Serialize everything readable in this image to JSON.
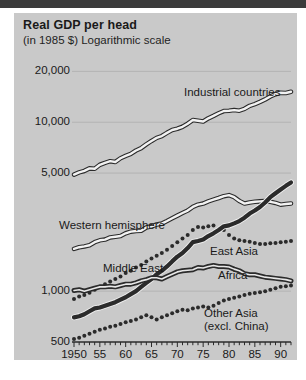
{
  "figure": {
    "title": "Real GDP per head",
    "subtitle": "(in 1985 $) Logarithmic scale",
    "panel_color": "#c9c9c9",
    "page_color": "#ffffff",
    "top_bar_color": "#3b3b3b"
  },
  "axes": {
    "y_ticks": [
      "500",
      "1,000",
      "5,000",
      "10,000",
      "20,000"
    ],
    "x_ticks": [
      "1950",
      "55",
      "60",
      "65",
      "70",
      "75",
      "80",
      "85",
      "90"
    ]
  },
  "labels": {
    "industrial": "Industrial countries",
    "western": "Western hemisphere",
    "middle_east": "Middle East",
    "east_asia": "East Asia",
    "africa": "Africa",
    "other_asia": "Other Asia",
    "other_asia_2": "(excl. China)"
  },
  "chart_data": {
    "type": "line",
    "title": "Real GDP per head",
    "subtitle": "(in 1985 $) Logarithmic scale",
    "xlabel": "",
    "ylabel": "Real GDP per head (1985 $)",
    "yscale": "log",
    "ylim": [
      500,
      24000
    ],
    "ytick_values": [
      500,
      1000,
      5000,
      10000,
      20000
    ],
    "ytick_labels": [
      "500",
      "1,000",
      "5,000",
      "10,000",
      "20,000"
    ],
    "xlim": [
      1950,
      1992
    ],
    "xtick_values": [
      1950,
      1955,
      1960,
      1965,
      1970,
      1975,
      1980,
      1985,
      1990
    ],
    "xtick_labels": [
      "1950",
      "55",
      "60",
      "65",
      "70",
      "75",
      "80",
      "85",
      "90"
    ],
    "grid": "horizontal",
    "legend": "inline-annotations",
    "x": [
      1950,
      1951,
      1952,
      1953,
      1954,
      1955,
      1956,
      1957,
      1958,
      1959,
      1960,
      1961,
      1962,
      1963,
      1964,
      1965,
      1966,
      1967,
      1968,
      1969,
      1970,
      1971,
      1972,
      1973,
      1974,
      1975,
      1976,
      1977,
      1978,
      1979,
      1980,
      1981,
      1982,
      1983,
      1984,
      1985,
      1986,
      1987,
      1988,
      1989,
      1990,
      1991,
      1992
    ],
    "series": [
      {
        "name": "Industrial countries",
        "style": "white-line-dark-outline",
        "values": [
          4900,
          5050,
          5150,
          5330,
          5300,
          5600,
          5750,
          5880,
          5820,
          6120,
          6320,
          6500,
          6800,
          7030,
          7400,
          7750,
          8080,
          8280,
          8650,
          9000,
          9150,
          9400,
          9800,
          10300,
          10200,
          10100,
          10550,
          10900,
          11300,
          11650,
          11700,
          11800,
          11700,
          12000,
          12500,
          12800,
          13200,
          13650,
          14200,
          14650,
          14950,
          14900,
          15150
        ]
      },
      {
        "name": "Western hemisphere",
        "style": "white-line-dark-outline",
        "values": [
          1780,
          1820,
          1840,
          1870,
          1950,
          2000,
          2020,
          2080,
          2100,
          2120,
          2200,
          2250,
          2270,
          2280,
          2380,
          2420,
          2480,
          2510,
          2600,
          2700,
          2800,
          2900,
          3000,
          3150,
          3250,
          3300,
          3400,
          3480,
          3560,
          3650,
          3700,
          3600,
          3420,
          3300,
          3350,
          3380,
          3400,
          3420,
          3380,
          3330,
          3250,
          3280,
          3300
        ]
      },
      {
        "name": "Middle East",
        "style": "dotted",
        "values": [
          900,
          930,
          950,
          980,
          1020,
          1060,
          1100,
          1140,
          1180,
          1220,
          1280,
          1320,
          1380,
          1430,
          1500,
          1560,
          1620,
          1680,
          1760,
          1850,
          1950,
          2050,
          2150,
          2300,
          2400,
          2380,
          2420,
          2450,
          2330,
          2300,
          2150,
          2050,
          2000,
          1980,
          1960,
          1930,
          1900,
          1900,
          1920,
          1930,
          1950,
          1960,
          1980
        ]
      },
      {
        "name": "East Asia",
        "style": "thick-dark-line",
        "values": [
          700,
          710,
          730,
          760,
          790,
          800,
          820,
          840,
          860,
          890,
          920,
          960,
          1000,
          1060,
          1120,
          1180,
          1260,
          1320,
          1400,
          1500,
          1600,
          1680,
          1800,
          1950,
          1980,
          2020,
          2120,
          2200,
          2300,
          2420,
          2450,
          2520,
          2600,
          2720,
          2880,
          3000,
          3150,
          3350,
          3600,
          3800,
          4000,
          4200,
          4400
        ]
      },
      {
        "name": "Africa",
        "style": "dark-line-white-core",
        "values": [
          1010,
          1020,
          1000,
          1020,
          1040,
          1060,
          1060,
          1070,
          1060,
          1080,
          1100,
          1100,
          1120,
          1150,
          1170,
          1200,
          1200,
          1180,
          1220,
          1260,
          1300,
          1320,
          1330,
          1340,
          1380,
          1370,
          1400,
          1420,
          1400,
          1400,
          1390,
          1350,
          1320,
          1270,
          1250,
          1250,
          1230,
          1210,
          1200,
          1190,
          1180,
          1170,
          1150
        ]
      },
      {
        "name": "Other Asia (excl. China)",
        "style": "dotted",
        "values": [
          520,
          530,
          545,
          560,
          575,
          590,
          600,
          615,
          625,
          640,
          655,
          665,
          680,
          700,
          720,
          700,
          680,
          700,
          720,
          740,
          760,
          775,
          770,
          790,
          800,
          810,
          800,
          820,
          850,
          880,
          900,
          915,
          930,
          950,
          965,
          975,
          985,
          1000,
          1020,
          1040,
          1060,
          1070,
          1080
        ]
      }
    ]
  }
}
